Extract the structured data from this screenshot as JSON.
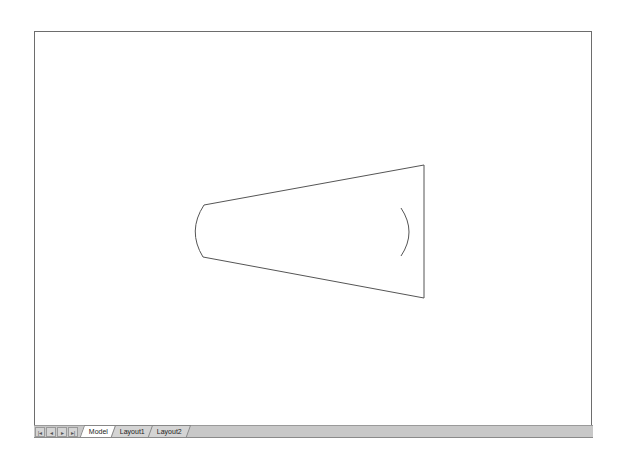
{
  "canvas": {
    "background": "#ffffff",
    "line_color": "#555555",
    "shape": "tapered quadrilateral with arc ends"
  },
  "tabs": {
    "nav_buttons": [
      {
        "name": "first",
        "glyph": "|◂"
      },
      {
        "name": "prev",
        "glyph": "◂"
      },
      {
        "name": "next",
        "glyph": "▸"
      },
      {
        "name": "last",
        "glyph": "▸|"
      }
    ],
    "items": [
      {
        "label": "Model",
        "active": true
      },
      {
        "label": "Layout1",
        "active": false
      },
      {
        "label": "Layout2",
        "active": false
      }
    ]
  }
}
